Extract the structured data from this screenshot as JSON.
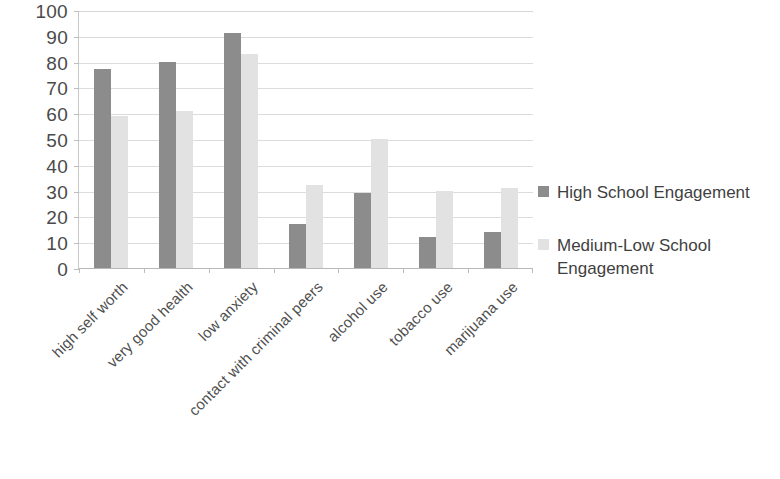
{
  "chart_data": {
    "type": "bar",
    "title": "",
    "subtitle": "",
    "xlabel": "",
    "ylabel": "",
    "ylim": [
      0,
      100
    ],
    "ytick_step": 10,
    "yticks": [
      100,
      90,
      80,
      70,
      60,
      50,
      40,
      30,
      20,
      10,
      0
    ],
    "grid": true,
    "legend_position": "right",
    "categories": [
      "high self worth",
      "very good health",
      "low anxiety",
      "contact with criminal peers",
      "alcohol use",
      "tobacco use",
      "marijuana use"
    ],
    "series": [
      {
        "name": "High School Engagement",
        "color": "#8c8c8c",
        "values": [
          77,
          80,
          91,
          17,
          29,
          12,
          14
        ]
      },
      {
        "name": "Medium-Low School Engagement",
        "color": "#e2e2e2",
        "values": [
          59,
          61,
          83,
          32,
          50,
          30,
          31
        ]
      }
    ]
  },
  "legend": {
    "items": [
      {
        "label": "High School Engagement",
        "color": "#8c8c8c"
      },
      {
        "label": "Medium-Low School Engagement",
        "color": "#e2e2e2"
      }
    ]
  },
  "axes": {
    "y": {
      "min": 0,
      "max": 100,
      "ticks": [
        "100",
        "90",
        "80",
        "70",
        "60",
        "50",
        "40",
        "30",
        "20",
        "10",
        "0"
      ]
    },
    "x": {
      "ticks": [
        "high self worth",
        "very good health",
        "low anxiety",
        "contact with criminal peers",
        "alcohol use",
        "tobacco use",
        "marijuana use"
      ]
    }
  }
}
